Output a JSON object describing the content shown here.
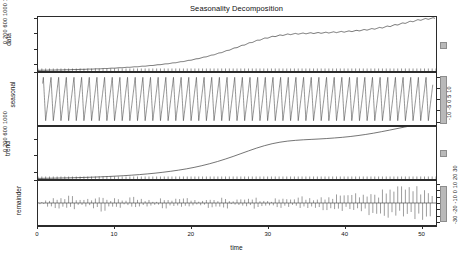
{
  "chart_data": {
    "type": "line",
    "title": "Seasonality Decomposition",
    "xlabel": "time",
    "ylabel": "",
    "xlim": [
      0,
      52
    ],
    "x_ticks": [
      0,
      10,
      20,
      30,
      40,
      50
    ],
    "grid": false,
    "legend": "none",
    "panels": [
      {
        "name": "data",
        "axis_side": "left",
        "ylim": [
          0,
          1450
        ],
        "y_ticks": [
          0,
          200,
          600,
          1000,
          1400
        ],
        "y_ticklabels": "0  200  600  1000  1400",
        "description": "Logistic/exponential growth curve with small seasonal ripples that grow with level",
        "values": [
          18,
          22,
          26,
          30,
          35,
          40,
          46,
          53,
          61,
          70,
          80,
          92,
          105,
          120,
          137,
          157,
          180,
          206,
          236,
          270,
          310,
          356,
          408,
          466,
          530,
          600,
          672,
          744,
          812,
          872,
          920,
          956,
          982,
          998,
          1008,
          1016,
          1022,
          1030,
          1040,
          1052,
          1066,
          1084,
          1106,
          1132,
          1164,
          1202,
          1244,
          1290,
          1336,
          1376,
          1404,
          1420
        ]
      },
      {
        "name": "seasonal",
        "axis_side": "right",
        "ylim": [
          -12,
          12
        ],
        "y_ticks": [
          -10,
          -5,
          0,
          5,
          10
        ],
        "y_ticklabels": "-10  -5  0  5  10",
        "description": "Regular sawtooth oscillation, period of about 1 time unit, amplitude near constant ~10",
        "amplitude": 10,
        "period": 1
      },
      {
        "name": "trend",
        "axis_side": "left",
        "ylim": [
          0,
          1300
        ],
        "y_ticks": [
          0,
          200,
          600,
          1000
        ],
        "y_ticklabels": "0  200  600  1000",
        "description": "Smooth S-shaped trend rising from near 0 to about 1250",
        "values": [
          15,
          18,
          21,
          25,
          29,
          34,
          40,
          46,
          54,
          62,
          72,
          83,
          96,
          110,
          127,
          146,
          168,
          193,
          221,
          253,
          290,
          333,
          382,
          437,
          498,
          564,
          634,
          704,
          772,
          832,
          882,
          920,
          948,
          966,
          980,
          990,
          1000,
          1012,
          1026,
          1042,
          1062,
          1086,
          1114,
          1146,
          1182,
          1220,
          1260,
          1300,
          1336,
          1368,
          1392,
          1410
        ]
      },
      {
        "name": "remainder",
        "axis_side": "right",
        "ylim": [
          -36,
          36
        ],
        "y_ticks": [
          -30,
          -20,
          -10,
          0,
          10,
          20,
          30
        ],
        "y_ticklabels": "-30  -20  -10  0  10  20  30",
        "description": "High-frequency residual spikes, amplitude increasing toward the right end of the series",
        "values": [
          2,
          6,
          -9,
          8,
          -12,
          5,
          -7,
          9,
          -14,
          6,
          -8,
          4,
          -10,
          7,
          -6,
          3,
          -9,
          5,
          -7,
          8,
          -5,
          4,
          -8,
          6,
          -9,
          3,
          -6,
          7,
          -10,
          5,
          -4,
          8,
          -7,
          6,
          -11,
          9,
          -8,
          12,
          -10,
          14,
          -13,
          16,
          -15,
          20,
          -18,
          24,
          -22,
          28,
          -26,
          30,
          -28,
          22
        ]
      }
    ]
  },
  "axis_titles": {
    "data": "data",
    "seasonal": "seasonal",
    "trend": "trend",
    "remainder": "remainder"
  },
  "colors": {
    "line": "#3a3a3a",
    "axis": "#2b2b2b",
    "scalebar": "#b9b9b9",
    "background": "#ffffff"
  }
}
